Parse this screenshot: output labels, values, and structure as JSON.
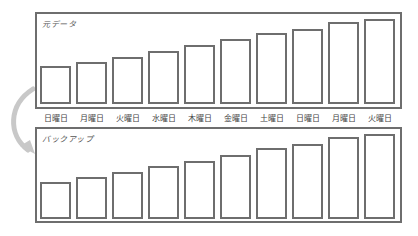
{
  "colors": {
    "stroke": "#6e6e6e",
    "arrow": "#c8c8c8",
    "text": "#444444"
  },
  "top_panel": {
    "title": "元データ",
    "bars": [
      {
        "day": "日曜日",
        "height": 38
      },
      {
        "day": "月曜日",
        "height": 42
      },
      {
        "day": "火曜日",
        "height": 47
      },
      {
        "day": "水曜日",
        "height": 53
      },
      {
        "day": "木曜日",
        "height": 59
      },
      {
        "day": "金曜日",
        "height": 65
      },
      {
        "day": "土曜日",
        "height": 71
      },
      {
        "day": "日曜日",
        "height": 75
      },
      {
        "day": "月曜日",
        "height": 82
      },
      {
        "day": "火曜日",
        "height": 85
      }
    ]
  },
  "bottom_panel": {
    "title": "バックアップ",
    "bars": [
      {
        "height": 37
      },
      {
        "height": 42
      },
      {
        "height": 47
      },
      {
        "height": 53
      },
      {
        "height": 58
      },
      {
        "height": 64
      },
      {
        "height": 71
      },
      {
        "height": 75
      },
      {
        "height": 82
      },
      {
        "height": 85
      }
    ]
  },
  "labels": {
    "d0": "日曜日",
    "d1": "月曜日",
    "d2": "火曜日",
    "d3": "水曜日",
    "d4": "木曜日",
    "d5": "金曜日",
    "d6": "土曜日",
    "d7": "日曜日",
    "d8": "月曜日",
    "d9": "火曜日"
  },
  "arrow": {
    "icon": "curved-arrow-down-icon"
  }
}
